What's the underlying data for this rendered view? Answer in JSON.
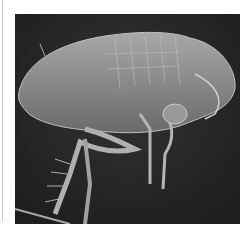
{
  "image": {
    "subject": "Scanning electron micrograph of a flea, side view",
    "alt": "SEM image of a flea on dark background"
  },
  "colors": {
    "background": "#2a2a2a",
    "body": "#8c8c8c",
    "highlight": "#c9c9c9"
  }
}
